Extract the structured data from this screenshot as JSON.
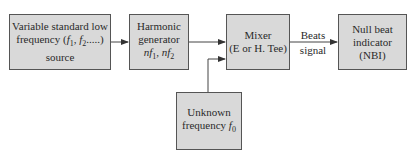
{
  "blocks": {
    "source": {
      "line1": "Variable standard low",
      "line2_pre": "frequency (",
      "f1": "f",
      "f1_sub": "1",
      "sep": ", ",
      "f2": "f",
      "f2_sub": "2",
      "line2_post": ".....)",
      "line3": "source"
    },
    "harmonic": {
      "line1": "Harmonic",
      "line2": "generator",
      "n1": "nf",
      "n1_sub": "1",
      "sep": ", ",
      "n2": "nf",
      "n2_sub": "2"
    },
    "mixer": {
      "line1": "Mixer",
      "line2": "(E or H. Tee)"
    },
    "nbi": {
      "line1": "Null beat",
      "line2": "indicator",
      "line3": "(NBI)"
    },
    "unknown": {
      "line1": "Unknown",
      "line2_pre": "frequency ",
      "f0": "f",
      "f0_sub": "0"
    }
  },
  "edges": {
    "beats_label_1": "Beats",
    "beats_label_2": "signal"
  },
  "colors": {
    "box_fill": "#d9d9d9",
    "stroke": "#555555"
  }
}
